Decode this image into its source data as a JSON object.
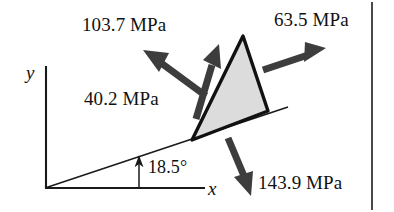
{
  "figure": {
    "type": "stress-element-free-body-diagram",
    "background_color": "#ffffff",
    "stroke_color": "#1a1a1a",
    "arrow_color": "#3d3d3d",
    "wedge_fill_color": "#dcdcdc"
  },
  "axes": {
    "x_label": "x",
    "y_label": "y",
    "origin": {
      "x": 45,
      "y": 188
    }
  },
  "angle": {
    "label": "18.5°",
    "value": 18.5,
    "unit": "degrees",
    "measured_from": "x"
  },
  "stresses": [
    {
      "id": "normal-upper-left",
      "label": "103.7 MPa",
      "value": 103.7,
      "unit": "MPa",
      "direction": "up-left"
    },
    {
      "id": "normal-upper-right",
      "label": "63.5 MPa",
      "value": 63.5,
      "unit": "MPa",
      "direction": "up-right"
    },
    {
      "id": "shear-incline",
      "label": "40.2 MPa",
      "value": 40.2,
      "unit": "MPa",
      "direction": "up-right-along-incline"
    },
    {
      "id": "normal-bottom",
      "label": "143.9 MPa",
      "value": 143.9,
      "unit": "MPa",
      "direction": "down"
    }
  ]
}
